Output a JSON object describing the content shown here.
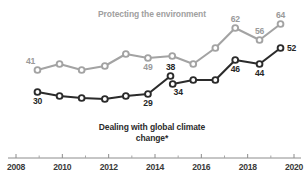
{
  "chart_data": {
    "type": "line",
    "title": "",
    "xlabel": "",
    "ylabel": "",
    "xlim": [
      2008,
      2020.4
    ],
    "ylim": [
      20,
      70
    ],
    "grid": false,
    "legend_position": "inline-annotations",
    "x_tick_labels": [
      "2008",
      "2010",
      "2012",
      "2014",
      "2016",
      "2018",
      "2020"
    ],
    "x_ticks_major": [
      2008,
      2010,
      2012,
      2014,
      2016,
      2018,
      2020
    ],
    "x_ticks_minor": [
      2009,
      2011,
      2013,
      2015,
      2017,
      2019
    ],
    "series": [
      {
        "name": "Protecting the environment",
        "color": "#a3a3a3",
        "label_color": "#a0a0a0",
        "x": [
          2008.7,
          2009.7,
          2010.7,
          2011.75,
          2012.7,
          2013.7,
          2014.8,
          2015.75,
          2016.75,
          2017.65,
          2018.75,
          2019.7
        ],
        "values": [
          41,
          44,
          41,
          43,
          49,
          47,
          48,
          44,
          52,
          62,
          56,
          64
        ],
        "labeled_points": [
          {
            "x": 2008.7,
            "value": 41,
            "text": "41",
            "position": "above-left"
          },
          {
            "x": 2013.7,
            "value": 47,
            "text": "49",
            "position": "below"
          },
          {
            "x": 2017.65,
            "value": 62,
            "text": "62",
            "position": "above"
          },
          {
            "x": 2018.75,
            "value": 56,
            "text": "56",
            "position": "above"
          },
          {
            "x": 2019.7,
            "value": 64,
            "text": "64",
            "position": "above"
          }
        ]
      },
      {
        "name": "Dealing with global climate change*",
        "color": "#2b2b2b",
        "label_color": "#1f1f1f",
        "x": [
          2008.7,
          2009.7,
          2010.7,
          2011.75,
          2012.7,
          2013.7,
          2014.72,
          2014.82,
          2015.75,
          2016.75,
          2017.65,
          2018.75,
          2019.7
        ],
        "values": [
          30,
          28,
          27,
          26.5,
          28,
          29,
          38,
          34,
          36,
          36,
          46,
          44,
          52
        ],
        "break_after_index": 6,
        "labeled_points": [
          {
            "x": 2008.7,
            "value": 30,
            "text": "30",
            "position": "below"
          },
          {
            "x": 2013.7,
            "value": 29,
            "text": "29",
            "position": "below"
          },
          {
            "x": 2014.72,
            "value": 38,
            "text": "38",
            "position": "above"
          },
          {
            "x": 2014.82,
            "value": 34,
            "text": "34",
            "position": "below-right"
          },
          {
            "x": 2017.65,
            "value": 46,
            "text": "46",
            "position": "below"
          },
          {
            "x": 2018.75,
            "value": 44,
            "text": "44",
            "position": "below"
          },
          {
            "x": 2019.7,
            "value": 52,
            "text": "52",
            "position": "right"
          }
        ]
      }
    ],
    "annotations": [
      {
        "name": "environment-series-label",
        "text": "Protecting the environment"
      },
      {
        "name": "climate-series-label-line1",
        "text": "Dealing with global climate"
      },
      {
        "name": "climate-series-label-line2",
        "text": "change*"
      }
    ]
  }
}
